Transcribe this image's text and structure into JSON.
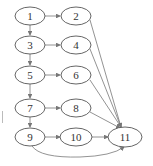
{
  "diagram": {
    "type": "flow-graph",
    "nodes": [
      {
        "id": "1",
        "label": "1",
        "cx": 30,
        "cy": 16
      },
      {
        "id": "2",
        "label": "2",
        "cx": 76,
        "cy": 16
      },
      {
        "id": "3",
        "label": "3",
        "cx": 30,
        "cy": 45
      },
      {
        "id": "4",
        "label": "4",
        "cx": 76,
        "cy": 45
      },
      {
        "id": "5",
        "label": "5",
        "cx": 30,
        "cy": 75
      },
      {
        "id": "6",
        "label": "6",
        "cx": 76,
        "cy": 75
      },
      {
        "id": "7",
        "label": "7",
        "cx": 30,
        "cy": 108
      },
      {
        "id": "8",
        "label": "8",
        "cx": 76,
        "cy": 108
      },
      {
        "id": "9",
        "label": "9",
        "cx": 30,
        "cy": 137
      },
      {
        "id": "10",
        "label": "10",
        "cx": 76,
        "cy": 137
      },
      {
        "id": "11",
        "label": "11",
        "cx": 125,
        "cy": 137
      }
    ],
    "edges": [
      {
        "from": "1",
        "to": "2"
      },
      {
        "from": "1",
        "to": "3"
      },
      {
        "from": "3",
        "to": "4"
      },
      {
        "from": "3",
        "to": "5"
      },
      {
        "from": "5",
        "to": "6"
      },
      {
        "from": "5",
        "to": "7"
      },
      {
        "from": "7",
        "to": "8"
      },
      {
        "from": "7",
        "to": "9"
      },
      {
        "from": "9",
        "to": "10"
      },
      {
        "from": "10",
        "to": "11"
      },
      {
        "from": "2",
        "to": "11"
      },
      {
        "from": "4",
        "to": "11"
      },
      {
        "from": "6",
        "to": "11"
      },
      {
        "from": "8",
        "to": "11"
      },
      {
        "from": "9",
        "to": "11",
        "curved": true
      }
    ]
  }
}
